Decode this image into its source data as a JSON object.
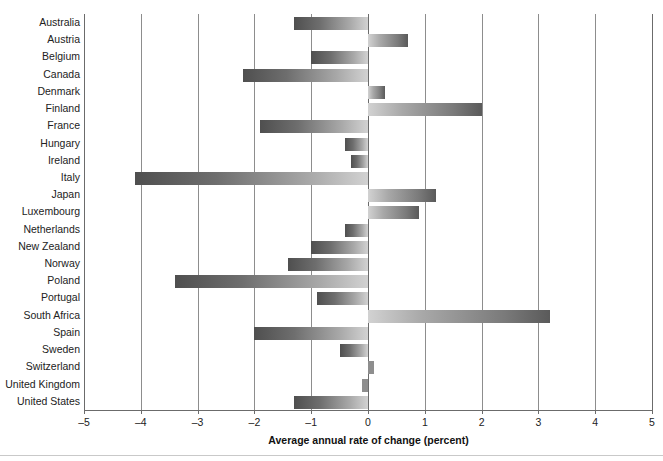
{
  "chart_data": {
    "type": "bar",
    "orientation": "horizontal",
    "title": "",
    "xlabel": "Average annual rate of change (percent)",
    "ylabel": "",
    "xlim": [
      -5,
      5
    ],
    "xticks": [
      -5,
      -4,
      -3,
      -2,
      -1,
      0,
      1,
      2,
      3,
      4,
      5
    ],
    "xtick_labels": [
      "–5",
      "–4",
      "–3",
      "–2",
      "–1",
      "0",
      "1",
      "2",
      "3",
      "4",
      "5"
    ],
    "grid": "vertical",
    "legend": "none",
    "categories": [
      "Australia",
      "Austria",
      "Belgium",
      "Canada",
      "Denmark",
      "Finland",
      "France",
      "Hungary",
      "Ireland",
      "Italy",
      "Japan",
      "Luxembourg",
      "Netherlands",
      "New Zealand",
      "Norway",
      "Poland",
      "Portugal",
      "South Africa",
      "Spain",
      "Sweden",
      "Switzerland",
      "United Kingdom",
      "United States"
    ],
    "values": [
      -1.3,
      0.7,
      -1.0,
      -2.2,
      0.3,
      2.0,
      -1.9,
      -0.4,
      -0.3,
      -4.1,
      1.2,
      0.9,
      -0.4,
      -1.0,
      -1.4,
      -3.4,
      -0.9,
      3.2,
      -2.0,
      -0.5,
      0.1,
      -0.1,
      -1.3
    ],
    "colors": {
      "negative_bar_dark": "#4f4f4f",
      "negative_bar_light": "#d2d2d2",
      "positive_bar_dark": "#5a5a5a",
      "positive_bar_light": "#d2d2d2",
      "axis": "#6b6b6b",
      "gridline": "#8d8d8d",
      "text": "#222222",
      "background": "#ffffff"
    }
  }
}
